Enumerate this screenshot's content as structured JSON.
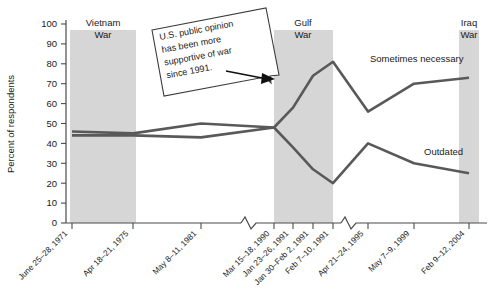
{
  "chart_data": {
    "type": "line",
    "title": "",
    "xlabel": "",
    "ylabel": "Percent of respondents",
    "ylim": [
      0,
      100
    ],
    "yticks": [
      0,
      10,
      20,
      30,
      40,
      50,
      60,
      70,
      80,
      90,
      100
    ],
    "grid": false,
    "legend_position": "inline-right",
    "categories": [
      "June 25–28, 1971",
      "Apr 18–21, 1975",
      "May 8–11, 1981",
      "Mar 15–18, 1990",
      "Jan 23–26, 1991",
      "Jan 30–Feb 2, 1991",
      "Feb 7–10, 1991",
      "Apr 21–24, 1995",
      "May 7–9, 1999",
      "Feb 9–12, 2004"
    ],
    "series": [
      {
        "name": "Sometimes necessary",
        "values": [
          46,
          45,
          50,
          48,
          58,
          74,
          81,
          56,
          70,
          73
        ]
      },
      {
        "name": "Outdated",
        "values": [
          44,
          44,
          43,
          48,
          38,
          27,
          20,
          40,
          30,
          25
        ]
      }
    ],
    "shaded_regions": [
      {
        "label": "Vietnam War",
        "label_line1": "Vietnam",
        "label_line2": "War",
        "start_category": "June 25–28, 1971",
        "end_category": "Apr 18–21, 1975"
      },
      {
        "label": "Gulf War",
        "label_line1": "Gulf",
        "label_line2": "War",
        "start_category": "Jan 23–26, 1991",
        "end_category": "Feb 7–10, 1991"
      },
      {
        "label": "Iraq War",
        "label_line1": "Iraq",
        "label_line2": "War",
        "start_category": "Feb 9–12, 2004",
        "end_category": "Feb 9–12, 2004"
      }
    ],
    "annotations": [
      {
        "text": "U.S. public opinion has been more supportive of war since 1991.",
        "line1": "U.S. public opinion",
        "line2": "has been more",
        "line3": "supportive of war",
        "line4": "since 1991.",
        "points_to": "Jan 23–26, 1991"
      }
    ],
    "axis_breaks": 2,
    "colors": {
      "series_line": "#595959",
      "shaded_band": "#d6d6d6",
      "axis": "#4a4a4a",
      "text": "#1a1a1a",
      "callout_border": "#3c3c3c"
    }
  }
}
